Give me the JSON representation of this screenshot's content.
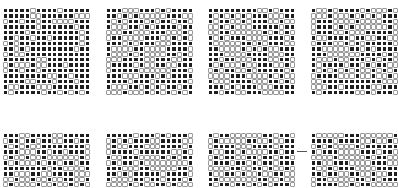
{
  "figure": {
    "caption": "· · · · ·",
    "panel_colors": {
      "dark": "#1e1e1e",
      "light": "#ffffff",
      "grid": "#9a9a9a"
    },
    "panels": [
      {
        "id": "p1",
        "row": 0,
        "x": 3,
        "y": 8,
        "cols": 16,
        "rows": 16,
        "seed": 11,
        "style": "dense"
      },
      {
        "id": "p2",
        "row": 0,
        "x": 106,
        "y": 8,
        "cols": 16,
        "rows": 16,
        "seed": 23,
        "style": "diag"
      },
      {
        "id": "p3",
        "row": 0,
        "x": 208,
        "y": 8,
        "cols": 16,
        "rows": 16,
        "seed": 37,
        "style": "diag2"
      },
      {
        "id": "p4",
        "row": 0,
        "x": 311,
        "y": 8,
        "cols": 16,
        "rows": 16,
        "seed": 41,
        "style": "mixed"
      },
      {
        "id": "p5",
        "row": 1,
        "x": 3,
        "y": 133,
        "cols": 16,
        "rows": 10,
        "seed": 53,
        "style": "mixed"
      },
      {
        "id": "p6",
        "row": 1,
        "x": 106,
        "y": 133,
        "cols": 16,
        "rows": 10,
        "seed": 67,
        "style": "diag"
      },
      {
        "id": "p7",
        "row": 1,
        "x": 208,
        "y": 133,
        "cols": 16,
        "rows": 10,
        "seed": 71,
        "style": "mixed"
      },
      {
        "id": "p8",
        "row": 1,
        "x": 311,
        "y": 133,
        "cols": 16,
        "rows": 10,
        "seed": 83,
        "style": "diag2"
      }
    ],
    "marker": {
      "type": "dash",
      "x": 297,
      "y": 151
    }
  }
}
